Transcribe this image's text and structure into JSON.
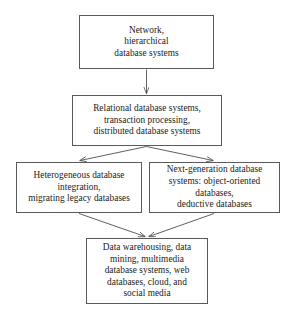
{
  "diagram": {
    "type": "flowchart",
    "orientation": "top-to-bottom",
    "background_color": "#ffffff",
    "box_border_color": "#595959",
    "arrow_color": "#4d4d4d",
    "text_color": "#1a1a1a",
    "nodes": [
      {
        "id": "network",
        "label": "Network,\nhierarchical\ndatabase systems",
        "lines": [
          "Network,",
          "hierarchical",
          "database systems"
        ],
        "level": 1
      },
      {
        "id": "relational",
        "label": "Relational database systems,\ntransaction processing,\ndistributed database systems",
        "lines": [
          "Relational database systems,",
          "transaction processing,",
          "distributed database systems"
        ],
        "level": 2
      },
      {
        "id": "heterogeneous",
        "label": "Heterogeneous database\nintegration,\nmigrating legacy databases",
        "lines": [
          "Heterogeneous database",
          "integration,",
          "migrating legacy databases"
        ],
        "level": 3
      },
      {
        "id": "nextgen",
        "label": "Next-generation database\nsystems: object-oriented\ndatabases,\ndeductive databases",
        "lines": [
          "Next-generation database",
          "systems: object-oriented",
          "databases,",
          "deductive databases"
        ],
        "level": 3
      },
      {
        "id": "datawarehouse",
        "label": "Data warehousing, data\nmining, multimedia\ndatabase systems, web\ndatabases, cloud, and\nsocial media",
        "lines": [
          "Data warehousing, data",
          "mining, multimedia",
          "database systems, web",
          "databases, cloud, and",
          "social media"
        ],
        "level": 4
      }
    ],
    "edges": [
      {
        "id": "network-to-relational",
        "from": "network",
        "to": "relational",
        "style": "straight-vertical-arrow"
      },
      {
        "id": "relational-to-heterogeneous",
        "from": "relational",
        "to": "heterogeneous",
        "style": "diagonal-arrow"
      },
      {
        "id": "relational-to-nextgen",
        "from": "relational",
        "to": "nextgen",
        "style": "diagonal-arrow"
      },
      {
        "id": "heterogeneous-to-datawarehouse",
        "from": "heterogeneous",
        "to": "datawarehouse",
        "style": "diagonal-arrow"
      },
      {
        "id": "nextgen-to-datawarehouse",
        "from": "nextgen",
        "to": "datawarehouse",
        "style": "diagonal-arrow"
      }
    ]
  }
}
